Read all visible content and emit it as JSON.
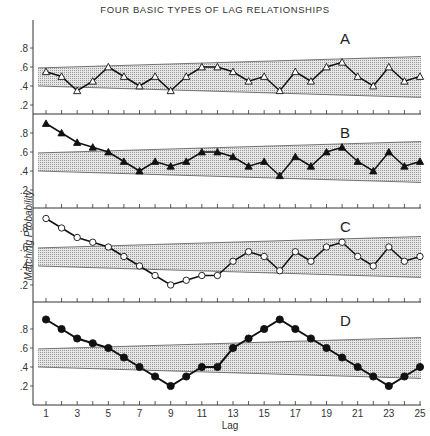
{
  "chart_data": {
    "type": "line",
    "title": "FOUR BASIC TYPES OF LAG RELATIONSHIPS",
    "xlabel": "Lag",
    "ylabel": "Matching Probability",
    "x": [
      1,
      2,
      3,
      4,
      5,
      6,
      7,
      8,
      9,
      10,
      11,
      12,
      13,
      14,
      15,
      16,
      17,
      18,
      19,
      20,
      21,
      22,
      23,
      24,
      25
    ],
    "x_tick_labels": [
      "1",
      "3",
      "5",
      "7",
      "9",
      "11",
      "13",
      "15",
      "17",
      "19",
      "21",
      "23",
      "25"
    ],
    "y_tick_labels": [
      ".2",
      ".4",
      ".6",
      ".8"
    ],
    "ylim": [
      0,
      1.0
    ],
    "band": {
      "description": "shaded chance band",
      "upper": {
        "start": 0.59,
        "end": 0.71
      },
      "lower": {
        "start": 0.4,
        "end": 0.28
      },
      "fill": "dotted gray"
    },
    "panels": [
      {
        "label": "A",
        "marker": "open-triangle",
        "values": [
          0.55,
          0.5,
          0.35,
          0.45,
          0.6,
          0.5,
          0.4,
          0.5,
          0.35,
          0.5,
          0.6,
          0.6,
          0.55,
          0.45,
          0.5,
          0.35,
          0.55,
          0.45,
          0.6,
          0.65,
          0.5,
          0.4,
          0.6,
          0.45,
          0.5
        ]
      },
      {
        "label": "B",
        "marker": "filled-triangle",
        "values": [
          0.9,
          0.8,
          0.7,
          0.65,
          0.6,
          0.5,
          0.4,
          0.5,
          0.45,
          0.5,
          0.6,
          0.6,
          0.55,
          0.45,
          0.5,
          0.35,
          0.55,
          0.45,
          0.6,
          0.65,
          0.5,
          0.4,
          0.6,
          0.45,
          0.5
        ]
      },
      {
        "label": "C",
        "marker": "open-circle",
        "values": [
          0.9,
          0.8,
          0.7,
          0.65,
          0.6,
          0.5,
          0.4,
          0.3,
          0.2,
          0.25,
          0.3,
          0.3,
          0.45,
          0.55,
          0.5,
          0.35,
          0.55,
          0.45,
          0.6,
          0.65,
          0.5,
          0.4,
          0.6,
          0.45,
          0.5
        ]
      },
      {
        "label": "D",
        "marker": "filled-circle",
        "values": [
          0.9,
          0.8,
          0.7,
          0.65,
          0.6,
          0.5,
          0.4,
          0.3,
          0.2,
          0.3,
          0.4,
          0.4,
          0.6,
          0.7,
          0.8,
          0.9,
          0.8,
          0.7,
          0.6,
          0.5,
          0.4,
          0.3,
          0.2,
          0.3,
          0.4
        ]
      }
    ],
    "grid": false,
    "legend": "none"
  }
}
